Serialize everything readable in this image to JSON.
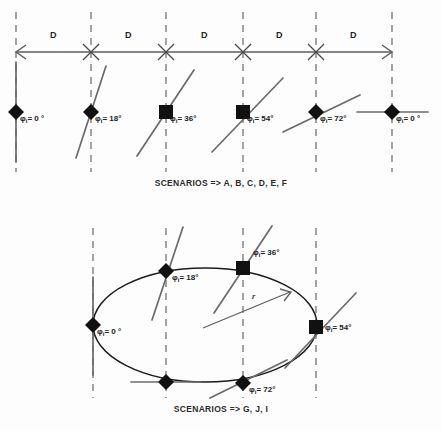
{
  "figure": {
    "type": "technical-diagram",
    "background_color": "#fdfdfd",
    "ink_color": "#222222",
    "line_color": "#555555",
    "marker_color": "#111111"
  },
  "top_panel": {
    "caption": "SCENARIOS => A, B, C, D, E, F",
    "axis": {
      "type": "double-headed-arrow",
      "y": 52,
      "x_start": 16,
      "x_end": 392,
      "cross_marker": "asterisk-cross",
      "cross_positions": [
        91,
        166,
        243,
        316
      ]
    },
    "spacing_labels": [
      {
        "text": "D",
        "x": 50,
        "y": 30
      },
      {
        "text": "D",
        "x": 125,
        "y": 30
      },
      {
        "text": "D",
        "x": 201,
        "y": 30
      },
      {
        "text": "D",
        "x": 276,
        "y": 30
      },
      {
        "text": "D",
        "x": 350,
        "y": 30
      }
    ],
    "stations": [
      {
        "id": "A",
        "angle_deg": 0,
        "label": "= 0 °",
        "symbol": "φ",
        "subscript": "i",
        "x": 16,
        "y": 112,
        "marker": "diamond",
        "blade_angle_deg": 90
      },
      {
        "id": "B",
        "angle_deg": 18,
        "label": "= 18°",
        "symbol": "φ",
        "subscript": "i",
        "x": 91,
        "y": 112,
        "marker": "diamond",
        "blade_angle_deg": 72
      },
      {
        "id": "C",
        "angle_deg": 36,
        "label": "= 36°",
        "symbol": "φ",
        "subscript": "i",
        "x": 166,
        "y": 112,
        "marker": "square",
        "blade_angle_deg": 54
      },
      {
        "id": "D",
        "angle_deg": 54,
        "label": "= 54°",
        "symbol": "φ",
        "subscript": "i",
        "x": 243,
        "y": 112,
        "marker": "square",
        "blade_angle_deg": 36
      },
      {
        "id": "E",
        "angle_deg": 72,
        "label": "= 72°",
        "symbol": "φ",
        "subscript": "i",
        "x": 316,
        "y": 112,
        "marker": "diamond",
        "blade_angle_deg": 18
      },
      {
        "id": "F",
        "angle_deg": 0,
        "label": "= 0 °",
        "symbol": "φ",
        "subscript": "i",
        "x": 392,
        "y": 112,
        "marker": "diamond",
        "blade_angle_deg": 0
      }
    ],
    "dashed_guides_x": [
      16,
      91,
      166,
      243,
      316,
      392
    ],
    "dashed_guide_y_top": 12,
    "dashed_guide_y_bottom": 172
  },
  "bottom_panel": {
    "caption": "SCENARIOS => G, J, I",
    "ellipse": {
      "center_x": 205,
      "center_y": 325,
      "radius_x": 112,
      "radius_y": 57
    },
    "radius_vector": {
      "label": "r",
      "label_x": 252,
      "label_y": 298,
      "from_x": 203,
      "from_y": 328,
      "to_x": 290,
      "to_y": 292
    },
    "dashed_guides_x": [
      93,
      166,
      243,
      316
    ],
    "dashed_guide_y_top": 228,
    "dashed_guide_y_bottom": 398,
    "stations": [
      {
        "id": "G",
        "angle_deg": 0,
        "label": "= 0 °",
        "symbol": "φ",
        "subscript": "i",
        "x": 93,
        "y": 325,
        "marker": "diamond",
        "blade_angle_deg": 90
      },
      {
        "id": "H",
        "angle_deg": 18,
        "label": "= 18°",
        "symbol": "φ",
        "subscript": "i",
        "x": 166,
        "y": 271,
        "marker": "diamond",
        "blade_angle_deg": 72
      },
      {
        "id": "I",
        "angle_deg": 36,
        "label": "= 36°",
        "symbol": "φ",
        "subscript": "i",
        "x": 243,
        "y": 268,
        "marker": "square",
        "blade_angle_deg": 54
      },
      {
        "id": "J",
        "angle_deg": 54,
        "label": "= 54°",
        "symbol": "φ",
        "subscript": "i",
        "x": 316,
        "y": 327,
        "marker": "square",
        "blade_angle_deg": 36
      },
      {
        "id": "K",
        "angle_deg": 72,
        "label": "= 72°",
        "symbol": "φ",
        "subscript": "i",
        "x": 243,
        "y": 383,
        "marker": "diamond",
        "blade_angle_deg": 18
      },
      {
        "id": "L",
        "angle_deg": 0,
        "label": "",
        "symbol": "",
        "subscript": "",
        "x": 166,
        "y": 382,
        "marker": "diamond",
        "blade_angle_deg": 0
      }
    ]
  }
}
